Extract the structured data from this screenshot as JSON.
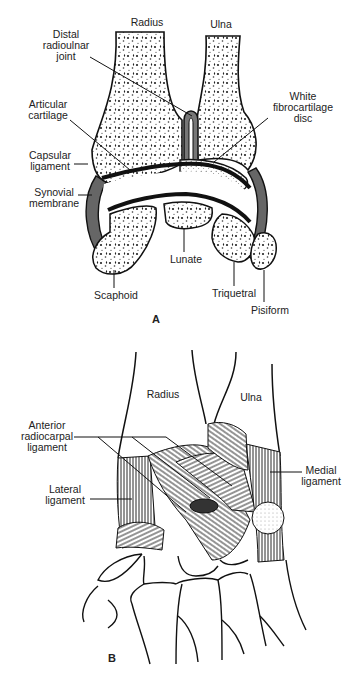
{
  "figure": {
    "panels": [
      {
        "id": "A",
        "letter": "A",
        "labels": {
          "radius": "Radius",
          "ulna": "Ulna",
          "distal_radioulnar_joint": [
            "Distal",
            "radioulnar",
            "joint"
          ],
          "articular_cartilage": [
            "Articular",
            "cartilage"
          ],
          "white_fibrocartilage_disc": [
            "White",
            "fibrocartilage",
            "disc"
          ],
          "capsular_ligament": [
            "Capsular",
            "ligament"
          ],
          "synovial_membrane": [
            "Synovial",
            "membrane"
          ],
          "lunate": "Lunate",
          "scaphoid": "Scaphoid",
          "triquetral": "Triquetral",
          "pisiform": "Pisiform"
        }
      },
      {
        "id": "B",
        "letter": "B",
        "labels": {
          "radius": "Radius",
          "ulna": "Ulna",
          "anterior_radiocarpal_ligament": [
            "Anterior",
            "radiocarpal",
            "ligament"
          ],
          "lateral_ligament": [
            "Lateral",
            "ligament"
          ],
          "medial_ligament": [
            "Medial",
            "ligament"
          ]
        }
      }
    ],
    "colors": {
      "line": "#111111",
      "cartilage": "#111111",
      "capsule": "#555555",
      "background": "#ffffff"
    }
  }
}
